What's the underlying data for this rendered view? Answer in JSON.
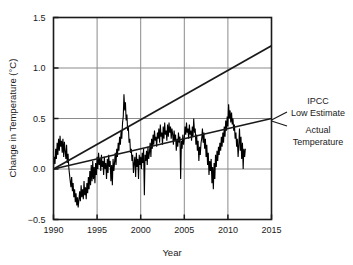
{
  "chart_data": {
    "type": "line",
    "title": "",
    "xlabel": "Year",
    "ylabel": "Change in Temperature (°C)",
    "xlim": [
      1990,
      2015
    ],
    "ylim": [
      -0.5,
      1.5
    ],
    "xticks": [
      1990,
      1995,
      2000,
      2005,
      2010,
      2015
    ],
    "xtick_labels": [
      "1990",
      "1995",
      "2000",
      "2005",
      "2010",
      "2015"
    ],
    "yticks": [
      -0.5,
      0.0,
      0.5,
      1.0,
      1.5
    ],
    "ytick_labels": [
      "−0.5",
      "0.0",
      "0.5",
      "1.0",
      "1.5"
    ],
    "grid": "both",
    "legend_position": "right-outside",
    "series": [
      {
        "name": "IPCC Low Estimate",
        "style": "straight-line",
        "color": "#1a1a1a",
        "x": [
          1990,
          2015
        ],
        "values": [
          0.0,
          1.22
        ]
      },
      {
        "name": "Actual Temperature",
        "style": "trend-line",
        "color": "#1a1a1a",
        "x": [
          1990,
          2015
        ],
        "values": [
          0.0,
          0.5
        ]
      },
      {
        "name": "Actual Temperature (monthly)",
        "style": "noisy-series",
        "color": "#000000",
        "x": [
          1990.0,
          1990.08,
          1990.17,
          1990.25,
          1990.33,
          1990.42,
          1990.5,
          1990.58,
          1990.67,
          1990.75,
          1990.83,
          1990.92,
          1991.0,
          1991.08,
          1991.17,
          1991.25,
          1991.33,
          1991.42,
          1991.5,
          1991.58,
          1991.67,
          1991.75,
          1991.83,
          1991.92,
          1992.0,
          1992.08,
          1992.17,
          1992.25,
          1992.33,
          1992.42,
          1992.5,
          1992.58,
          1992.67,
          1992.75,
          1992.83,
          1992.92,
          1993.0,
          1993.08,
          1993.17,
          1993.25,
          1993.33,
          1993.42,
          1993.5,
          1993.58,
          1993.67,
          1993.75,
          1993.83,
          1993.92,
          1994.0,
          1994.08,
          1994.17,
          1994.25,
          1994.33,
          1994.42,
          1994.5,
          1994.58,
          1994.67,
          1994.75,
          1994.83,
          1994.92,
          1995.0,
          1995.08,
          1995.17,
          1995.25,
          1995.33,
          1995.42,
          1995.5,
          1995.58,
          1995.67,
          1995.75,
          1995.83,
          1995.92,
          1996.0,
          1996.08,
          1996.17,
          1996.25,
          1996.33,
          1996.42,
          1996.5,
          1996.58,
          1996.67,
          1996.75,
          1996.83,
          1996.92,
          1997.0,
          1997.08,
          1997.17,
          1997.25,
          1997.33,
          1997.42,
          1997.5,
          1997.58,
          1997.67,
          1997.75,
          1997.83,
          1997.92,
          1998.0,
          1998.08,
          1998.17,
          1998.25,
          1998.33,
          1998.42,
          1998.5,
          1998.58,
          1998.67,
          1998.75,
          1998.83,
          1998.92,
          1999.0,
          1999.08,
          1999.17,
          1999.25,
          1999.33,
          1999.42,
          1999.5,
          1999.58,
          1999.67,
          1999.75,
          1999.83,
          1999.92,
          2000.0,
          2000.08,
          2000.17,
          2000.25,
          2000.33,
          2000.42,
          2000.5,
          2000.58,
          2000.67,
          2000.75,
          2000.83,
          2000.92,
          2001.0,
          2001.08,
          2001.17,
          2001.25,
          2001.33,
          2001.42,
          2001.5,
          2001.58,
          2001.67,
          2001.75,
          2001.83,
          2001.92,
          2002.0,
          2002.08,
          2002.17,
          2002.25,
          2002.33,
          2002.42,
          2002.5,
          2002.58,
          2002.67,
          2002.75,
          2002.83,
          2002.92,
          2003.0,
          2003.08,
          2003.17,
          2003.25,
          2003.33,
          2003.42,
          2003.5,
          2003.58,
          2003.67,
          2003.75,
          2003.83,
          2003.92,
          2004.0,
          2004.08,
          2004.17,
          2004.25,
          2004.33,
          2004.42,
          2004.5,
          2004.58,
          2004.67,
          2004.75,
          2004.83,
          2004.92,
          2005.0,
          2005.08,
          2005.17,
          2005.25,
          2005.33,
          2005.42,
          2005.5,
          2005.58,
          2005.67,
          2005.75,
          2005.83,
          2005.92,
          2006.0,
          2006.08,
          2006.17,
          2006.25,
          2006.33,
          2006.42,
          2006.5,
          2006.58,
          2006.67,
          2006.75,
          2006.83,
          2006.92,
          2007.0,
          2007.08,
          2007.17,
          2007.25,
          2007.33,
          2007.42,
          2007.5,
          2007.58,
          2007.67,
          2007.75,
          2007.83,
          2007.92,
          2008.0,
          2008.08,
          2008.17,
          2008.25,
          2008.33,
          2008.42,
          2008.5,
          2008.58,
          2008.67,
          2008.75,
          2008.83,
          2008.92,
          2009.0,
          2009.08,
          2009.17,
          2009.25,
          2009.33,
          2009.42,
          2009.5,
          2009.58,
          2009.67,
          2009.75,
          2009.83,
          2009.92,
          2010.0,
          2010.08,
          2010.17,
          2010.25,
          2010.33,
          2010.42,
          2010.5,
          2010.58,
          2010.67,
          2010.75,
          2010.83,
          2010.92,
          2011.0,
          2011.08,
          2011.17,
          2011.25,
          2011.33,
          2011.42,
          2011.5,
          2011.58,
          2011.67,
          2011.75,
          2011.83,
          2011.92,
          2012.0
        ],
        "values": [
          0.02,
          0.12,
          0.05,
          0.2,
          0.1,
          0.26,
          0.14,
          0.3,
          0.18,
          0.33,
          0.22,
          0.28,
          0.16,
          0.3,
          0.12,
          0.27,
          0.18,
          0.1,
          0.24,
          0.06,
          0.15,
          0.02,
          -0.05,
          -0.12,
          -0.18,
          -0.08,
          -0.22,
          -0.14,
          -0.28,
          -0.2,
          -0.33,
          -0.24,
          -0.36,
          -0.28,
          -0.38,
          -0.3,
          -0.22,
          -0.32,
          -0.16,
          -0.28,
          -0.2,
          -0.3,
          -0.12,
          -0.26,
          -0.18,
          -0.3,
          -0.14,
          -0.24,
          -0.08,
          -0.2,
          -0.02,
          -0.16,
          0.04,
          -0.12,
          0.08,
          -0.1,
          0.02,
          -0.14,
          0.06,
          -0.06,
          0.12,
          0.0,
          0.16,
          0.04,
          0.1,
          -0.02,
          0.14,
          0.02,
          0.08,
          -0.06,
          0.12,
          0.0,
          0.06,
          -0.1,
          0.1,
          -0.04,
          0.14,
          0.02,
          0.08,
          -0.12,
          0.04,
          -0.16,
          0.1,
          -0.02,
          0.06,
          0.16,
          0.04,
          0.2,
          0.12,
          0.26,
          0.18,
          0.32,
          0.24,
          0.38,
          0.3,
          0.46,
          0.52,
          0.74,
          0.58,
          0.66,
          0.48,
          0.54,
          0.38,
          0.42,
          0.26,
          0.3,
          0.16,
          0.2,
          0.08,
          0.14,
          -0.04,
          0.06,
          0.12,
          -0.08,
          0.16,
          0.02,
          0.1,
          -0.1,
          0.14,
          0.04,
          0.12,
          0.0,
          0.16,
          0.06,
          0.2,
          -0.26,
          0.14,
          0.08,
          0.18,
          0.04,
          0.22,
          0.1,
          0.16,
          0.26,
          0.12,
          0.3,
          0.2,
          0.34,
          0.24,
          0.38,
          0.28,
          0.32,
          0.22,
          0.36,
          0.3,
          0.4,
          0.26,
          0.44,
          0.32,
          0.36,
          0.24,
          0.42,
          0.3,
          0.46,
          0.34,
          0.38,
          0.28,
          0.44,
          0.32,
          0.46,
          0.36,
          0.42,
          0.3,
          0.4,
          0.34,
          0.24,
          0.38,
          0.28,
          0.34,
          0.18,
          0.3,
          0.22,
          0.36,
          0.26,
          0.32,
          -0.1,
          0.28,
          0.2,
          0.34,
          0.24,
          0.3,
          0.42,
          0.34,
          0.46,
          0.36,
          0.4,
          0.3,
          0.44,
          0.34,
          0.38,
          0.28,
          0.42,
          0.32,
          0.5,
          0.36,
          0.4,
          0.24,
          0.34,
          0.18,
          0.28,
          0.08,
          0.22,
          0.14,
          0.26,
          0.3,
          0.4,
          0.26,
          0.36,
          0.2,
          0.3,
          0.12,
          0.24,
          0.04,
          0.16,
          -0.06,
          0.08,
          -0.02,
          0.1,
          -0.14,
          0.02,
          -0.2,
          0.06,
          -0.1,
          0.14,
          0.02,
          0.18,
          0.08,
          0.22,
          0.14,
          0.26,
          0.18,
          0.32,
          0.22,
          0.36,
          0.26,
          0.42,
          0.32,
          0.48,
          0.38,
          0.52,
          0.42,
          0.64,
          0.5,
          0.58,
          0.46,
          0.56,
          0.44,
          0.5,
          0.38,
          0.44,
          0.3,
          0.36,
          0.22,
          0.3,
          0.12,
          0.24,
          0.4,
          0.18,
          0.32,
          0.1,
          0.26,
          0.0,
          0.2,
          0.12,
          0.2
        ]
      }
    ],
    "annotations": [
      {
        "text": "IPCC",
        "target": "IPCC Low Estimate"
      },
      {
        "text": "Low Estimate",
        "target": "IPCC Low Estimate"
      },
      {
        "text": "Actual",
        "target": "Actual Temperature"
      },
      {
        "text": "Temperature",
        "target": "Actual Temperature"
      }
    ]
  },
  "legend": {
    "ipcc_line1": "IPCC",
    "ipcc_line2": "Low Estimate",
    "actual_line1": "Actual",
    "actual_line2": "Temperature"
  },
  "colors": {
    "axis": "#1a1a1a",
    "grid": "#8a8a8a",
    "data": "#000000"
  }
}
